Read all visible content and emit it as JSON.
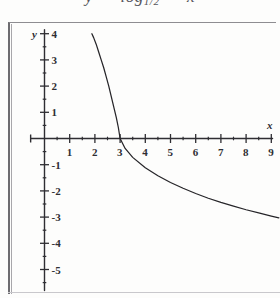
{
  "header": {
    "clipped_formula": {
      "lhs": "y",
      "equals": "=",
      "func": "log",
      "base": "1/2",
      "arg": "x"
    }
  },
  "chart_data": {
    "type": "line",
    "xlabel": "x",
    "ylabel": "y",
    "xlim": [
      -0.6,
      9.4
    ],
    "ylim": [
      -5.8,
      4.3
    ],
    "grid": false,
    "legend": null,
    "x_ticks_major": [
      1,
      2,
      3,
      4,
      5,
      6,
      7,
      8,
      9
    ],
    "x_tick_labels": [
      "1",
      "2",
      "3",
      "4",
      "5",
      "6",
      "7",
      "8",
      "9"
    ],
    "x_ticks_minor": [
      0.5,
      1.5,
      2.5,
      3.5,
      4.5,
      5.5,
      6.5,
      7.5,
      8.5
    ],
    "y_ticks_major": [
      4,
      3,
      2,
      1,
      -1,
      -2,
      -3,
      -4,
      -5
    ],
    "y_tick_labels": [
      "4",
      "3",
      "2",
      "1",
      "-1",
      "-2",
      "-3",
      "-4",
      "-5"
    ],
    "y_ticks_minor": [
      3.5,
      2.5,
      1.5,
      0.5,
      -0.5,
      -1.5,
      -2.5,
      -3.5,
      -4.5,
      -5.5
    ],
    "x_root": 3,
    "vertical_asymptote": 0,
    "curve_color": "#262529",
    "axis_color": "#2f2e33",
    "series": [
      {
        "name": "y = log base 1/2 of (x/3)",
        "points": [
          {
            "x": 1.88,
            "y": 4.0
          },
          {
            "x": 1.95,
            "y": 3.85
          },
          {
            "x": 2.05,
            "y": 3.6
          },
          {
            "x": 2.15,
            "y": 3.3
          },
          {
            "x": 2.25,
            "y": 3.0
          },
          {
            "x": 2.35,
            "y": 2.7
          },
          {
            "x": 2.45,
            "y": 2.35
          },
          {
            "x": 2.55,
            "y": 2.0
          },
          {
            "x": 2.65,
            "y": 1.6
          },
          {
            "x": 2.75,
            "y": 1.2
          },
          {
            "x": 2.85,
            "y": 0.8
          },
          {
            "x": 2.93,
            "y": 0.42
          },
          {
            "x": 3.0,
            "y": 0.0
          },
          {
            "x": 3.2,
            "y": -0.38
          },
          {
            "x": 3.5,
            "y": -0.72
          },
          {
            "x": 4.0,
            "y": -1.12
          },
          {
            "x": 4.5,
            "y": -1.42
          },
          {
            "x": 5.0,
            "y": -1.68
          },
          {
            "x": 5.5,
            "y": -1.9
          },
          {
            "x": 6.0,
            "y": -2.1
          },
          {
            "x": 6.5,
            "y": -2.28
          },
          {
            "x": 7.0,
            "y": -2.44
          },
          {
            "x": 7.5,
            "y": -2.58
          },
          {
            "x": 8.0,
            "y": -2.72
          },
          {
            "x": 8.5,
            "y": -2.84
          },
          {
            "x": 9.0,
            "y": -2.96
          },
          {
            "x": 9.3,
            "y": -3.03
          }
        ]
      }
    ]
  }
}
